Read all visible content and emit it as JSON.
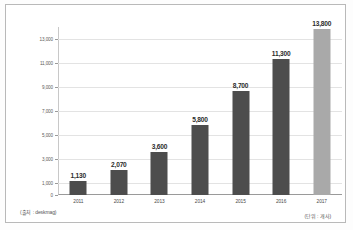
{
  "chart_data": {
    "type": "bar",
    "title": "",
    "subtitle": "",
    "xlabel": "",
    "ylabel": "",
    "categories": [
      "2011",
      "2012",
      "2013",
      "2014",
      "2015",
      "2016",
      "2017"
    ],
    "values": [
      1130,
      2070,
      3600,
      5800,
      8700,
      11300,
      13800
    ],
    "value_labels": [
      "1,130",
      "2,070",
      "3,600",
      "5,800",
      "8,700",
      "11,300",
      "13,800"
    ],
    "series": [
      {
        "name": "coworking-spaces",
        "values": [
          1130,
          2070,
          3600,
          5800,
          8700,
          11300,
          13800
        ]
      }
    ],
    "ylim": [
      0,
      14000
    ],
    "yticks": [
      0,
      1000,
      3000,
      5000,
      7000,
      9000,
      11000,
      13000
    ],
    "ytick_labels": [
      "0",
      "1,000",
      "3,000",
      "5,000",
      "7,000",
      "9,000",
      "11,000",
      "13,000"
    ],
    "grid": true,
    "legend": false,
    "bar_colors": [
      "#4d4d4d",
      "#4d4d4d",
      "#4d4d4d",
      "#4d4d4d",
      "#4d4d4d",
      "#4d4d4d",
      "#a9a9a9"
    ],
    "highlight_category": "2017",
    "annotations": {
      "source": "(출처 : deskmag)",
      "unit": "(단위 : 개사)"
    }
  },
  "colors": {
    "bar_dark": "#4d4d4d",
    "bar_light": "#a9a9a9",
    "gridline": "#e3e3e3",
    "axis": "#9a9a9a",
    "frame": "#b9b9b9",
    "text": "#2b2b2b",
    "background": "#ffffff"
  }
}
